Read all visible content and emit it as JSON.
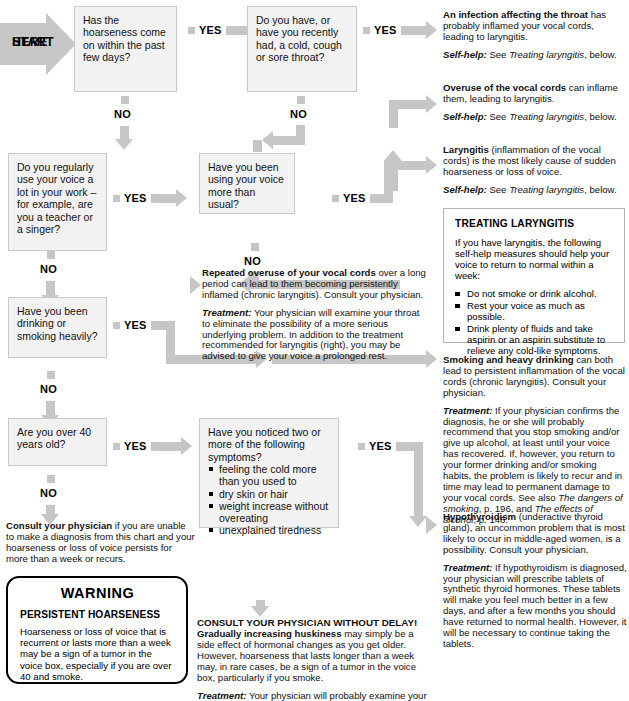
{
  "chart_title": "Hoarseness or loss of voice diagnostic flowchart",
  "labels": {
    "yes": "YES",
    "no": "NO",
    "start": "START\nHERE",
    "start_line1": "START",
    "start_line2": "HERE"
  },
  "questions": {
    "q1": "Has the hoarseness come on within the past few days?",
    "q2": "Do you have, or have you recently had, a cold, cough or sore throat?",
    "q3": "Do you regularly use your voice a lot in your work – for example, are you a teacher or a singer?",
    "q4": "Have you been using your voice more than usual?",
    "q5": "Have you been drinking or smoking heavily?",
    "q6": "Are you over 40 years old?",
    "q7_stem": "Have you noticed two or more of the following symptoms?",
    "q7_items": [
      "feeling the cold more than you used to",
      "dry skin or hair",
      "weight increase without overeating",
      "unexplained tiredness"
    ]
  },
  "answers": {
    "infection": {
      "lead": "An infection affecting the throat",
      "body": " has probably inflamed your vocal cords, leading to laryngitis.",
      "selfhelp_label": "Self-help:",
      "selfhelp_pre": " See ",
      "selfhelp_italic": "Treating laryngitis",
      "selfhelp_post": ", below."
    },
    "overuse": {
      "lead": "Overuse of the vocal cords",
      "body": " can inflame them, leading to laryngitis.",
      "selfhelp_label": "Self-help:",
      "selfhelp_pre": " See ",
      "selfhelp_italic": "Treating laryngitis",
      "selfhelp_post": ", below."
    },
    "laryngitis": {
      "lead": "Laryngitis",
      "body": " (inflammation of the vocal cords) is the most likely cause of sudden hoarseness or loss of voice.",
      "selfhelp_label": "Self-help:",
      "selfhelp_pre": " See ",
      "selfhelp_italic": "Treating laryngitis",
      "selfhelp_post": ", below."
    },
    "repeated_overuse": {
      "lead": "Repeated overuse of your vocal cords",
      "body": " over a long period can lead to them becoming persistently inflamed (chronic laryngitis). Consult your physician.",
      "treat_label": "Treatment:",
      "treat_body": " Your physician will examine your throat to eliminate the possibility of a more serious underlying problem. In addition to the treatment recommended for laryngitis (right), you may be advised to give your voice a prolonged rest."
    },
    "smoking": {
      "lead": "Smoking and heavy drinking",
      "body": " can both lead to persistent inflammation of the vocal cords (chronic laryngitis). Consult your physician.",
      "treat_label": "Treatment:",
      "treat_body1": " If your physician confirms the diagnosis, he or she will probably recommend that you stop smoking and/or give up alcohol, at least until your voice has recovered. If, however, you return to your former drinking and/or smoking habits, the problem is likely to recur and in time may lead to permanent damage to your vocal cords. See also ",
      "treat_ref1": "The dangers of smoking",
      "treat_mid": ", p. 196, and ",
      "treat_ref2": "The effects of alcohol",
      "treat_end": ", p. 146."
    },
    "hypothyroidism": {
      "lead": "Hypothyroidism",
      "body": " (underactive thyroid gland), an uncommon problem that is most likely to occur in middle-aged women, is a possibility. Consult your physician.",
      "treat_label": "Treatment:",
      "treat_body": " If hypothyroidism is diagnosed, your physician will prescribe tablets of synthetic thyroid hormones. These tablets will make you feel much better in a few days, and after a few months you should have returned to normal health. However, it will be necessary to continue taking the tablets."
    },
    "consult": {
      "lead": "Consult your physician",
      "body": " if you are unable to make a diagnosis from this chart and your hoarseness or loss of voice persists for more than a week or recurs."
    },
    "delay": {
      "head": "CONSULT YOUR PHYSICIAN WITHOUT DELAY!",
      "lead": "Gradually increasing huskiness",
      "body": " may simply be a side effect of hormonal changes as you get older. However, hoarseness that lasts longer than a week may, in rare cases, be a sign of a tumor in the voice box, particularly if you smoke.",
      "treat_label": "Treatment:",
      "treat_body": " Your physician will probably examine your"
    }
  },
  "panel": {
    "title": "TREATING LARYNGITIS",
    "intro": "If you have laryngitis, the following self-help measures should help your voice to return to normal within a week:",
    "items": [
      "Do not smoke or drink alcohol.",
      "Rest your voice as much as possible.",
      "Drink plenty of fluids and take aspirin or an aspirin substitute to relieve any cold-like symptoms."
    ]
  },
  "warning": {
    "title": "WARNING",
    "subtitle": "PERSISTENT HOARSENESS",
    "body": "Hoarseness or loss of voice that is recurrent or lasts more than a week may be a sign of a tumor in the voice box, especially if you are over 40 and smoke.",
    "cutoff_lead": "Consult your physician without",
    "cutoff_rest": " ..."
  },
  "colors": {
    "arrow": "#c6c6c6",
    "box_fill": "#f2f2f2",
    "box_border": "#c9c9c9",
    "text": "#111111",
    "page_bg": "#ffffff"
  }
}
